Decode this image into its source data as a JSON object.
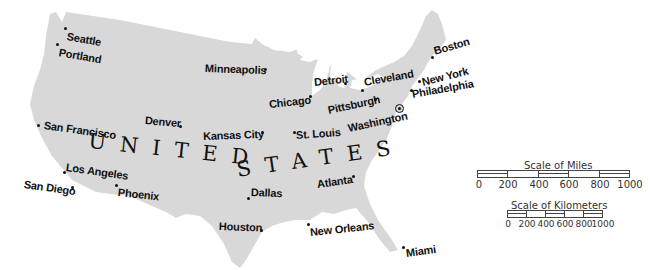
{
  "map": {
    "country_label": "UNITED STATES",
    "country_words": [
      "UNITED",
      "STATES"
    ],
    "colors": {
      "land": "#d8d8d8",
      "water": "#ffffff",
      "text": "#111111"
    },
    "capital": {
      "name": "Washington",
      "symbol": "star-in-circle"
    },
    "cities": [
      {
        "name": "Seattle"
      },
      {
        "name": "Portland"
      },
      {
        "name": "San Francisco"
      },
      {
        "name": "Los Angeles"
      },
      {
        "name": "San Diego"
      },
      {
        "name": "Phoenix"
      },
      {
        "name": "Denver"
      },
      {
        "name": "Minneapolis"
      },
      {
        "name": "Kansas City"
      },
      {
        "name": "St. Louis"
      },
      {
        "name": "Chicago"
      },
      {
        "name": "Detroit"
      },
      {
        "name": "Cleveland"
      },
      {
        "name": "Pittsburgh"
      },
      {
        "name": "Washington"
      },
      {
        "name": "Philadelphia"
      },
      {
        "name": "New York"
      },
      {
        "name": "Boston"
      },
      {
        "name": "Atlanta"
      },
      {
        "name": "Dallas"
      },
      {
        "name": "Houston"
      },
      {
        "name": "New Orleans"
      },
      {
        "name": "Miami"
      }
    ]
  },
  "scales": {
    "miles": {
      "title": "Scale of Miles",
      "ticks": [
        "0",
        "200",
        "400",
        "600",
        "800",
        "1000"
      ]
    },
    "kilometers": {
      "title": "Scale of Kilometers",
      "ticks": [
        "0",
        "200",
        "400",
        "600",
        "800",
        "1000"
      ]
    }
  }
}
